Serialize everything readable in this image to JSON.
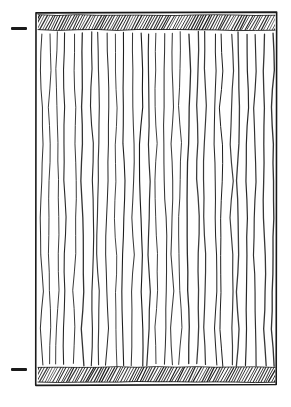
{
  "figure": {
    "title": "Hatched panel with vertical striations",
    "background_color": "#ffffff",
    "ink_color": "#1a1a1a",
    "style": "hand-drawn ink line art"
  },
  "canvas": {
    "width": 291,
    "height": 407
  },
  "frame": {
    "name": "outer-rectangle",
    "x": 36,
    "y": 13,
    "width": 241,
    "height": 372,
    "stroke_color": "#1a1a1a",
    "stroke_width": 1.6
  },
  "bands": [
    {
      "name": "top-hatch-band",
      "position": "top",
      "x": 38,
      "y": 15,
      "width": 237,
      "height": 15,
      "hatch_angle_deg": 62,
      "hatch_spacing": 2.7,
      "hatch_count": 88,
      "stroke_color": "#1a1a1a"
    },
    {
      "name": "bottom-hatch-band",
      "position": "bottom",
      "x": 38,
      "y": 367,
      "width": 237,
      "height": 15,
      "hatch_angle_deg": 62,
      "hatch_spacing": 2.7,
      "hatch_count": 88,
      "stroke_color": "#1a1a1a"
    }
  ],
  "striations": {
    "name": "vertical-line-field",
    "count": 29,
    "top_y": 33,
    "bottom_y": 365,
    "left_x": 41,
    "right_x": 272,
    "spacing": 8.25,
    "stroke_color": "#1a1a1a",
    "stroke_width": 1.15,
    "waviness_amplitude": 1.8,
    "orientation": "vertical"
  },
  "margin_marks": [
    {
      "name": "upper-tick-dash",
      "x": 11,
      "y": 27,
      "width": 16,
      "height": 3,
      "color": "#1a1a1a"
    },
    {
      "name": "lower-tick-dash",
      "x": 11,
      "y": 368,
      "width": 16,
      "height": 3,
      "color": "#1a1a1a"
    }
  ]
}
